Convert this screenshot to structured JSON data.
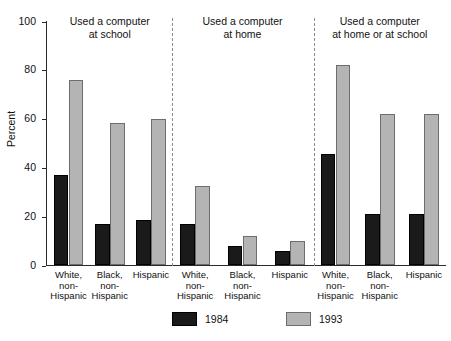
{
  "chart_data": {
    "type": "bar",
    "title": "",
    "xlabel": "",
    "ylabel": "Percent",
    "ylim": [
      0,
      100
    ],
    "yticks": [
      "0",
      "20",
      "40",
      "60",
      "80",
      "100"
    ],
    "grid": false,
    "legend_position": "bottom",
    "panels": [
      {
        "title_line1": "Used a computer",
        "title_line2": "at school",
        "categories": [
          "White, non-Hispanic",
          "Black, non-Hispanic",
          "Hispanic"
        ],
        "series": [
          {
            "name": "1984",
            "values": [
              37,
              17,
              18.5
            ]
          },
          {
            "name": "1993",
            "values": [
              76,
              58.5,
              60
            ]
          }
        ]
      },
      {
        "title_line1": "Used a computer",
        "title_line2": "at home",
        "categories": [
          "White, non-Hispanic",
          "Black, non-Hispanic",
          "Hispanic"
        ],
        "series": [
          {
            "name": "1984",
            "values": [
              17,
              8,
              6
            ]
          },
          {
            "name": "1993",
            "values": [
              32.5,
              12,
              10
            ]
          }
        ]
      },
      {
        "title_line1": "Used a computer",
        "title_line2": "at home or at school",
        "categories": [
          "White, non-Hispanic",
          "Black, non-Hispanic",
          "Hispanic"
        ],
        "series": [
          {
            "name": "1984",
            "values": [
              45.5,
              21,
              21
            ]
          },
          {
            "name": "1993",
            "values": [
              82,
              62,
              62
            ]
          }
        ]
      }
    ],
    "legend": [
      {
        "label": "1984",
        "color": "#1a1a1a"
      },
      {
        "label": "1993",
        "color": "#b4b4b4"
      }
    ],
    "category_lines": [
      [
        "White,",
        "non-",
        "Hispanic"
      ],
      [
        "Black,",
        "non-",
        "Hispanic"
      ],
      [
        "Hispanic",
        "",
        ""
      ]
    ]
  }
}
